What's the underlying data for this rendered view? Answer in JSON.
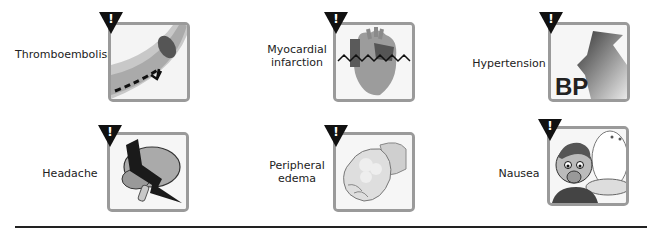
{
  "figure": {
    "items": [
      {
        "label": "Thromboembolism",
        "icon": "thromboembolism-icon"
      },
      {
        "label": "Myocardial infarction",
        "label_lines": [
          "Myocardial",
          "infarction"
        ],
        "icon": "heart-icon"
      },
      {
        "label": "Hypertension",
        "icon": "bp-arrow-icon",
        "icon_text": "BP"
      },
      {
        "label": "Headache",
        "icon": "brain-lightning-icon"
      },
      {
        "label": "Peripheral edema",
        "label_lines": [
          "Peripheral",
          "edema"
        ],
        "icon": "swollen-hand-icon"
      },
      {
        "label": "Nausea",
        "icon": "nausea-face-icon"
      }
    ],
    "warning_glyph": "!",
    "colors": {
      "box_border": "#9a9a9a",
      "warning": "#111111",
      "rule": "#222222"
    }
  }
}
